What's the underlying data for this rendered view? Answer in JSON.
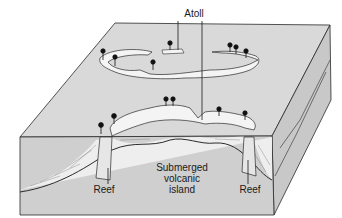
{
  "diagram": {
    "title": "Atoll",
    "labels": {
      "atoll": "Atoll",
      "reef_left": "Reef",
      "reef_right": "Reef",
      "volcano_line1": "Submerged",
      "volcano_line2": "volcanic",
      "volcano_line3": "island"
    },
    "colors": {
      "ocean_surface": "#d9d9d9",
      "cross_section": "#cfcfcf",
      "island_land": "#f4f4f4",
      "outline": "#2a2a2a",
      "sediment": "#eeeeee"
    },
    "icons": [
      "palm-tree-icon"
    ]
  }
}
